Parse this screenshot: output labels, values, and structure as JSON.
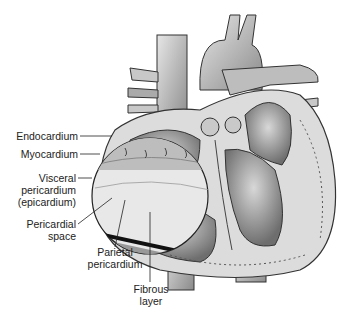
{
  "figure": {
    "labels": {
      "endocardium": "Endocardium",
      "myocardium": "Myocardium",
      "visceral_1": "Visceral",
      "visceral_2": "pericardium",
      "visceral_3": "(epicardium)",
      "pericardial_space_1": "Pericardial",
      "pericardial_space_2": "space",
      "parietal_1": "Parietal",
      "parietal_2": "pericardium",
      "fibrous_1": "Fibrous",
      "fibrous_2": "layer"
    }
  }
}
